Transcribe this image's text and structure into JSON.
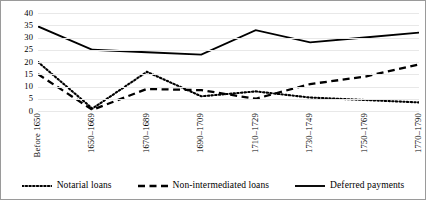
{
  "chart_data": {
    "type": "line",
    "title": "",
    "xlabel": "",
    "ylabel": "",
    "ylim": [
      0,
      40
    ],
    "yticks": [
      0,
      5,
      10,
      15,
      20,
      25,
      30,
      35,
      40
    ],
    "grid": true,
    "legend_position": "bottom",
    "categories": [
      "Before 1650",
      "1650–1669",
      "1670–1689",
      "1690–1709",
      "1710–1729",
      "1730–1749",
      "1750–1769",
      "1770–1790"
    ],
    "series": [
      {
        "name": "Notarial loans",
        "style": "dotted",
        "color": "#000000",
        "values": [
          20,
          1,
          16,
          6,
          8,
          5.5,
          4.5,
          3.5
        ]
      },
      {
        "name": "Non-intermediated loans",
        "style": "dashed",
        "color": "#000000",
        "values": [
          15,
          0.5,
          9,
          8.5,
          5,
          11,
          14,
          19
        ]
      },
      {
        "name": "Deferred payments",
        "style": "solid",
        "color": "#000000",
        "values": [
          34.5,
          25,
          24,
          23,
          33,
          28,
          30,
          32
        ]
      }
    ]
  },
  "legend": {
    "items": [
      {
        "label": "Notarial loans",
        "style": "dotted"
      },
      {
        "label": "Non-intermediated loans",
        "style": "dashed"
      },
      {
        "label": "Deferred payments",
        "style": "solid"
      }
    ]
  }
}
